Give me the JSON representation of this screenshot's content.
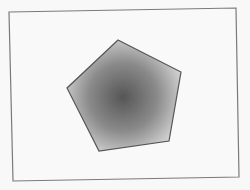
{
  "figure": {
    "background": "#f8f8f8",
    "frame": {
      "points": "9,12 236,8 239,177 13,181",
      "stroke": "#7a7a7a",
      "fill": "#f9f9f9"
    },
    "pentagon": {
      "points": "118,40 181,72 169,141 99,151 67,88",
      "stroke": "#555555",
      "gradient_center": "#565656",
      "gradient_mid": "#8a8a8a",
      "gradient_edge": "#d2d2d2"
    }
  }
}
